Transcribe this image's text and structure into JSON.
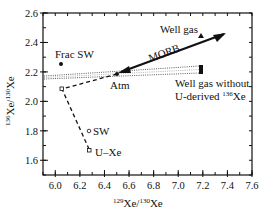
{
  "chart_data": {
    "type": "scatter",
    "title": "",
    "xlabel": "129Xe/130Xe",
    "ylabel": "136Xe/130Xe",
    "xlim": [
      5.9,
      7.6
    ],
    "ylim": [
      1.5,
      2.6
    ],
    "grid": false,
    "x_ticks": [
      "6.0",
      "6.2",
      "6.4",
      "6.6",
      "6.8",
      "7.0",
      "7.2",
      "7.4",
      "7.6"
    ],
    "y_ticks": [
      "1.6",
      "1.8",
      "2.0",
      "2.2",
      "2.4",
      "2.6"
    ],
    "points": [
      {
        "label": "Frac SW",
        "x": 6.03,
        "y": 2.25,
        "marker": "filled-circle"
      },
      {
        "label": "Atm",
        "x": 6.5,
        "y": 2.18,
        "marker": "filled-circle"
      },
      {
        "label": "SW",
        "x": 6.26,
        "y": 1.79,
        "marker": "open-circle"
      },
      {
        "label": "U-Xe",
        "x": 6.27,
        "y": 1.66,
        "marker": "open-square"
      },
      {
        "label": "",
        "x": 6.04,
        "y": 2.08,
        "marker": "open-square"
      },
      {
        "label": "Well gas",
        "x": 7.2,
        "y": 2.45,
        "marker": "filled-triangle"
      },
      {
        "label": "Well gas without U-derived 136Xe",
        "x": 7.2,
        "y": 2.22,
        "marker": "filled-bar"
      }
    ],
    "lines": [
      {
        "name": "MORB",
        "style": "solid-arrow",
        "from": [
          7.37,
          2.45
        ],
        "to": [
          6.5,
          2.18
        ]
      },
      {
        "name": "Atm-mix dashed",
        "style": "dashed",
        "points": [
          [
            6.5,
            2.18
          ],
          [
            6.04,
            2.08
          ],
          [
            6.27,
            1.66
          ]
        ]
      },
      {
        "name": "Well gas without range",
        "style": "dotted-wedge",
        "from": [
          5.9,
          2.17
        ],
        "to": [
          7.2,
          2.22
        ]
      }
    ],
    "annotations": [
      "Frac SW",
      "Atm",
      "SW",
      "U–Xe",
      "Well gas",
      "MORB",
      "Well gas without",
      "U-derived 136Xe"
    ]
  },
  "labels": {
    "frac_sw": "Frac SW",
    "atm": "Atm",
    "sw": "SW",
    "uxe": "U–Xe",
    "well_gas": "Well gas",
    "morb": "MORB",
    "well_gas_without_1": "Well gas without",
    "well_gas_without_2a": "U-derived ",
    "well_gas_without_2sup": "136",
    "well_gas_without_2b": "Xe",
    "xlabel_sup1": "129",
    "xlabel_a": "Xe/",
    "xlabel_sup2": "130",
    "xlabel_b": "Xe",
    "ylabel_sup1": "136",
    "ylabel_a": "Xe/",
    "ylabel_sup2": "130",
    "ylabel_b": "Xe"
  }
}
